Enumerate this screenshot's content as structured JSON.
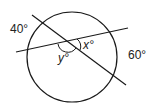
{
  "diagram": {
    "type": "circle with two intersecting secants",
    "stroke_color": "#1a1a1a",
    "labels": {
      "arc_left": "40°",
      "arc_right": "60°",
      "angle_x": "x°",
      "angle_y": "y°"
    }
  }
}
